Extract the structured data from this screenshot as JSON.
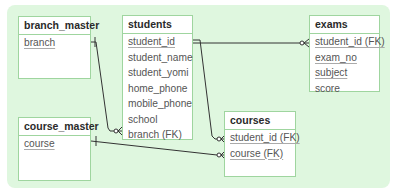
{
  "diagram": {
    "type": "er-diagram",
    "background_color": "#dff7df",
    "border_color": "#9fd59f",
    "entities": {
      "branch_master": {
        "name": "branch_master",
        "fields": [
          {
            "name": "branch",
            "underlined": true
          }
        ]
      },
      "students": {
        "name": "students",
        "fields": [
          {
            "name": "student_id",
            "underlined": true
          },
          {
            "name": "student_name",
            "underlined": false
          },
          {
            "name": "student_yomi",
            "underlined": false
          },
          {
            "name": "home_phone",
            "underlined": false
          },
          {
            "name": "mobile_phone",
            "underlined": false
          },
          {
            "name": "school",
            "underlined": false
          },
          {
            "name": "branch (FK)",
            "underlined": false
          }
        ]
      },
      "exams": {
        "name": "exams",
        "fields": [
          {
            "name": "student_id (FK)",
            "underlined": true
          },
          {
            "name": "exam_no",
            "underlined": true
          },
          {
            "name": "subject",
            "underlined": true
          },
          {
            "name": "score",
            "underlined": false
          }
        ]
      },
      "course_master": {
        "name": "course_master",
        "fields": [
          {
            "name": "course",
            "underlined": true
          }
        ]
      },
      "courses": {
        "name": "courses",
        "fields": [
          {
            "name": "student_id (FK)",
            "underlined": true
          },
          {
            "name": "course (FK)",
            "underlined": true
          }
        ]
      }
    },
    "relationships": [
      {
        "from": "branch_master.branch",
        "to": "students.branch (FK)",
        "from_cardinality": "one",
        "to_cardinality": "zero-or-many"
      },
      {
        "from": "students.student_id",
        "to": "exams.student_id (FK)",
        "from_cardinality": "one",
        "to_cardinality": "zero-or-many"
      },
      {
        "from": "students.student_id",
        "to": "courses.student_id (FK)",
        "from_cardinality": "one",
        "to_cardinality": "zero-or-many"
      },
      {
        "from": "course_master.course",
        "to": "courses.course (FK)",
        "from_cardinality": "one",
        "to_cardinality": "zero-or-many"
      }
    ]
  }
}
